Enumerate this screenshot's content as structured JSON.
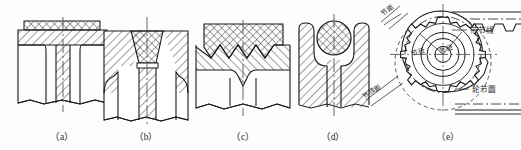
{
  "figure": {
    "background_color": "#fdfdfd",
    "line_color": "#1a1a1a",
    "hatch_color": "#2b2b2b",
    "canvas": {
      "width": 521,
      "height": 150
    }
  },
  "captions": [
    {
      "key": "a",
      "label": "（a）",
      "x": 62,
      "y": 140
    },
    {
      "key": "b",
      "label": "（b）",
      "x": 146,
      "y": 140
    },
    {
      "key": "c",
      "label": "（c）",
      "x": 243,
      "y": 140
    },
    {
      "key": "d",
      "label": "（d）",
      "x": 333,
      "y": 140
    },
    {
      "key": "e",
      "label": "（e）",
      "x": 448,
      "y": 140
    }
  ],
  "subfigures": [
    {
      "key": "a",
      "caption": "（a）",
      "description": "Trapezoidal flat tooth with cross-hatched facing strip over diagonally hatched body",
      "insert_shape": "flat-band",
      "insert_hatch": "cross",
      "body_hatch": "diagonal"
    },
    {
      "key": "b",
      "caption": "（b）",
      "description": "Dovetail trapezoidal cross-hatched insert seated in diagonally hatched body",
      "insert_shape": "trapezoid",
      "insert_hatch": "cross",
      "body_hatch": "diagonal"
    },
    {
      "key": "c",
      "caption": "（c）",
      "description": "Serrated zigzag interface between cross-hatched facing and diagonally hatched body",
      "insert_shape": "serrated-band",
      "insert_hatch": "cross",
      "body_hatch": "diagonal"
    },
    {
      "key": "d",
      "caption": "（d）",
      "description": "Round cross-hatched cord seated in a U-shaped cradle of diagonally hatched body",
      "insert_shape": "circle",
      "insert_hatch": "cross",
      "body_hatch": "diagonal"
    },
    {
      "key": "e",
      "caption": "（e）",
      "description": "Toothed sprocket meshing with a timing belt, showing pitch geometry callouts",
      "insert_shape": "sprocket",
      "insert_hatch": "none",
      "body_hatch": "none"
    }
  ],
  "annotations_e": {
    "belt_pitch_line": {
      "text": "带节线",
      "meaning": "belt pitch line",
      "x": 470,
      "y": 33
    },
    "wheel_pitch_circle": {
      "text": "轮节圆",
      "meaning": "wheel pitch circle",
      "x": 472,
      "y": 92
    },
    "pitch_top": {
      "text": "节距",
      "meaning": "pitch",
      "x": 391,
      "y": 13,
      "rotation": -38
    },
    "pitch_bottom": {
      "text": "节顶距",
      "meaning": "pitch-to-tip distance",
      "x": 372,
      "y": 93,
      "rotation": -28
    },
    "pitch_diameter": {
      "text": "节径",
      "meaning": "pitch diameter",
      "x": 416,
      "y": 55,
      "rotation": -20
    },
    "outer_diameter": {
      "text": "外径",
      "meaning": "outer diameter",
      "x": 441,
      "y": 52,
      "rotation": -20
    }
  },
  "sprocket": {
    "center_x": 443,
    "center_y": 62,
    "tooth_count": 16,
    "outer_radius": 45,
    "pitch_radius": 38,
    "root_radius": 31,
    "hub_outer_radius": 22,
    "hub_inner_radius": 16,
    "bore_radius": 8
  }
}
